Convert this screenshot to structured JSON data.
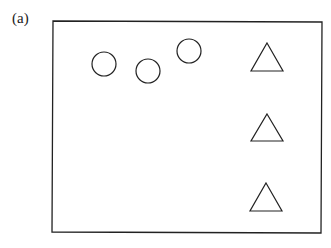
{
  "figure": {
    "panel_label": "(a)",
    "frame": {
      "x1": 53,
      "y1": 21,
      "x2": 322,
      "y2": 233
    },
    "circles": [
      {
        "cx": 104,
        "cy": 64,
        "r": 12
      },
      {
        "cx": 148,
        "cy": 71,
        "r": 12
      },
      {
        "cx": 189,
        "cy": 51,
        "r": 12
      }
    ],
    "triangles": [
      {
        "apex": [
          267,
          43
        ],
        "left": [
          251,
          71
        ],
        "right": [
          283,
          71
        ]
      },
      {
        "apex": [
          267,
          114
        ],
        "left": [
          251,
          141
        ],
        "right": [
          283,
          141
        ]
      },
      {
        "apex": [
          266,
          183
        ],
        "left": [
          250,
          211
        ],
        "right": [
          282,
          211
        ]
      }
    ],
    "stroke_color": "#222222",
    "background": "#ffffff"
  }
}
